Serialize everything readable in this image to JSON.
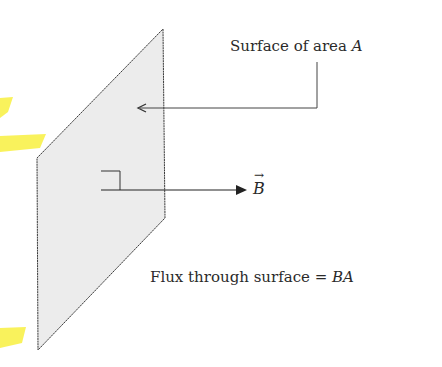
{
  "diagram": {
    "labels": {
      "surface_prefix": "Surface of area ",
      "surface_var": "A",
      "field_var": "B",
      "field_vector_mark": "→",
      "flux_prefix": "Flux through surface = ",
      "flux_expr": "BA"
    },
    "colors": {
      "surface_fill": "#ececec",
      "line": "#333333",
      "highlight": "#f7ef3a"
    }
  }
}
